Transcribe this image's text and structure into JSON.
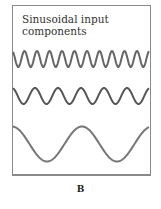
{
  "figure": {
    "title_line1": "Sinusoidal input",
    "title_line2": "components",
    "label": "B",
    "wave_color": "#666666",
    "frame_color": "#8a8a8a"
  },
  "waves": [
    {
      "name": "high-frequency",
      "center_y": 59,
      "amplitude": 8,
      "period": 12.5,
      "phase_x": 12
    },
    {
      "name": "mid-frequency",
      "center_y": 96,
      "amplitude": 8,
      "period": 23,
      "phase_x": 12
    },
    {
      "name": "low-frequency",
      "center_y": 144,
      "amplitude": 17.5,
      "period": 70,
      "phase_x": 12
    }
  ]
}
